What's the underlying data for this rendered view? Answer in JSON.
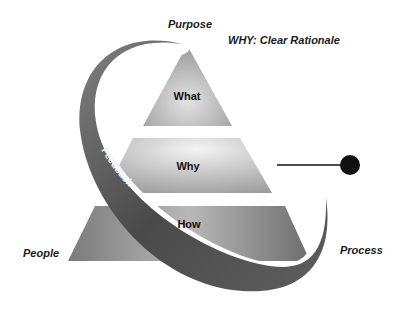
{
  "diagram": {
    "labels": {
      "top": "Purpose",
      "subtitle": "WHY: Clear Rationale",
      "left": "People",
      "right": "Process"
    },
    "tiers": [
      {
        "label": "What"
      },
      {
        "label": "Why"
      },
      {
        "label": "How"
      }
    ],
    "arc_label": "Feedback",
    "colors": {
      "tier_light": "#e6e6e6",
      "tier_dark": "#8a8a8a",
      "arc": "#5a5a5a",
      "dot": "#111111"
    }
  }
}
